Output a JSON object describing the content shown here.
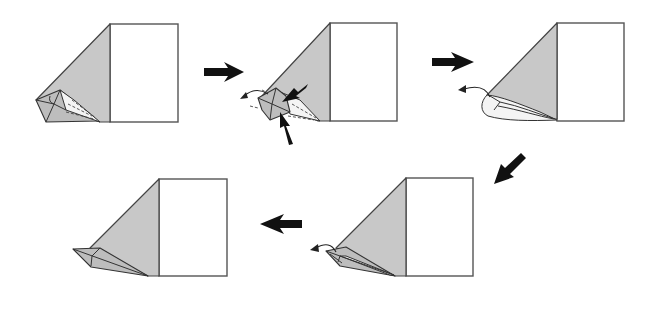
{
  "diagram": {
    "type": "origami-folding-sequence",
    "colors": {
      "paper_white": "#ffffff",
      "paper_grey": "#c8c8c8",
      "outline": "#444444",
      "arrow": "#111111"
    },
    "steps": [
      {
        "index": 1,
        "description": "Model with collapsed point at lower-left",
        "paper_square": {
          "x": 110,
          "y": 24,
          "w": 68,
          "h": 98
        }
      },
      {
        "index": 2,
        "description": "Push in at the two marked points and swing tip left",
        "paper_square": {
          "x": 330,
          "y": 23,
          "w": 67,
          "h": 98
        },
        "push_arrows": 2,
        "curl_arrow": "left"
      },
      {
        "index": 3,
        "description": "Rounded point, fold tip outward to left",
        "paper_square": {
          "x": 557,
          "y": 23,
          "w": 67,
          "h": 98
        },
        "curl_arrow": "left"
      },
      {
        "index": 4,
        "description": "Flattened narrow point, swing tip left",
        "paper_square": {
          "x": 406,
          "y": 178,
          "w": 67,
          "h": 98
        },
        "curl_arrow": "left"
      },
      {
        "index": 5,
        "description": "Finished beak-like point",
        "paper_square": {
          "x": 159,
          "y": 179,
          "w": 68,
          "h": 97
        }
      }
    ],
    "step_arrows": [
      {
        "from": 1,
        "to": 2,
        "direction": "right"
      },
      {
        "from": 2,
        "to": 3,
        "direction": "right"
      },
      {
        "from": 3,
        "to": 4,
        "direction": "down-left"
      },
      {
        "from": 4,
        "to": 5,
        "direction": "left"
      }
    ]
  }
}
